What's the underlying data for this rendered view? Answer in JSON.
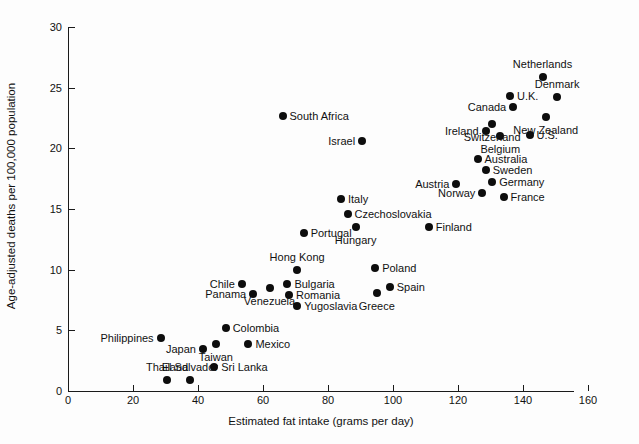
{
  "chart_data": {
    "type": "scatter",
    "title": "",
    "xlabel": "Estimated fat intake (grams per day)",
    "ylabel": "Age-adjusted deaths per 100,000 population",
    "xlim": [
      0,
      175
    ],
    "ylim": [
      0,
      30
    ],
    "xticks": [
      0,
      20,
      40,
      60,
      80,
      100,
      120,
      140,
      160
    ],
    "xtick_labels": [
      "0",
      "20",
      "40",
      "60",
      "80",
      "100",
      "120",
      "140",
      "160"
    ],
    "yticks": [
      0,
      5,
      10,
      15,
      20,
      25,
      30
    ],
    "ytick_labels": [
      "0",
      "5",
      "10",
      "15",
      "20",
      "25",
      "30"
    ],
    "grid": false,
    "legend": "none",
    "marker": "filled-circle",
    "marker_color": "#0d0d0d",
    "points": [
      {
        "label": "Thailand",
        "x": 30.5,
        "y": 0.9,
        "pos": "above"
      },
      {
        "label": "El Salvador",
        "x": 37.5,
        "y": 0.9,
        "pos": "above"
      },
      {
        "label": "Sri Lanka",
        "x": 45.0,
        "y": 2.0,
        "pos": "right"
      },
      {
        "label": "Japan",
        "x": 41.5,
        "y": 3.5,
        "pos": "left"
      },
      {
        "label": "Taiwan",
        "x": 45.5,
        "y": 3.9,
        "pos": "below"
      },
      {
        "label": "Mexico",
        "x": 55.5,
        "y": 3.9,
        "pos": "right"
      },
      {
        "label": "Philippines",
        "x": 28.5,
        "y": 4.4,
        "pos": "left"
      },
      {
        "label": "Colombia",
        "x": 48.5,
        "y": 5.2,
        "pos": "right"
      },
      {
        "label": "Venezuela",
        "x": 62.0,
        "y": 8.5,
        "pos": "below"
      },
      {
        "label": "Panama",
        "x": 57.0,
        "y": 8.0,
        "pos": "left"
      },
      {
        "label": "Chile",
        "x": 53.5,
        "y": 8.8,
        "pos": "left"
      },
      {
        "label": "Yugoslavia",
        "x": 70.5,
        "y": 7.0,
        "pos": "right"
      },
      {
        "label": "Romania",
        "x": 68.0,
        "y": 7.9,
        "pos": "right"
      },
      {
        "label": "Bulgaria",
        "x": 67.5,
        "y": 8.8,
        "pos": "right"
      },
      {
        "label": "Hong Kong",
        "x": 70.5,
        "y": 10.0,
        "pos": "above"
      },
      {
        "label": "Greece",
        "x": 95.0,
        "y": 8.1,
        "pos": "below"
      },
      {
        "label": "Spain",
        "x": 99.0,
        "y": 8.6,
        "pos": "right"
      },
      {
        "label": "Poland",
        "x": 94.5,
        "y": 10.1,
        "pos": "right"
      },
      {
        "label": "Portugal",
        "x": 72.5,
        "y": 13.0,
        "pos": "right"
      },
      {
        "label": "Hungary",
        "x": 88.5,
        "y": 13.5,
        "pos": "below"
      },
      {
        "label": "Czechoslovakia",
        "x": 86.0,
        "y": 14.6,
        "pos": "right"
      },
      {
        "label": "Finland",
        "x": 111.0,
        "y": 13.5,
        "pos": "right"
      },
      {
        "label": "Italy",
        "x": 84.0,
        "y": 15.8,
        "pos": "right"
      },
      {
        "label": "Austria",
        "x": 119.5,
        "y": 17.1,
        "pos": "left"
      },
      {
        "label": "Norway",
        "x": 127.5,
        "y": 16.3,
        "pos": "left"
      },
      {
        "label": "France",
        "x": 134.0,
        "y": 16.0,
        "pos": "right"
      },
      {
        "label": "Germany",
        "x": 130.5,
        "y": 17.2,
        "pos": "right"
      },
      {
        "label": "Sweden",
        "x": 128.5,
        "y": 18.2,
        "pos": "right"
      },
      {
        "label": "Australia",
        "x": 126.0,
        "y": 19.1,
        "pos": "right"
      },
      {
        "label": "Israel",
        "x": 90.5,
        "y": 20.6,
        "pos": "left"
      },
      {
        "label": "Belgium",
        "x": 133.0,
        "y": 21.0,
        "pos": "below"
      },
      {
        "label": "U.S.",
        "x": 142.0,
        "y": 21.1,
        "pos": "right"
      },
      {
        "label": "Ireland",
        "x": 128.5,
        "y": 21.4,
        "pos": "left"
      },
      {
        "label": "Switzerland",
        "x": 130.5,
        "y": 22.0,
        "pos": "below"
      },
      {
        "label": "New Zealand",
        "x": 147.0,
        "y": 22.6,
        "pos": "below"
      },
      {
        "label": "South Africa",
        "x": 66.0,
        "y": 22.7,
        "pos": "right"
      },
      {
        "label": "Canada",
        "x": 137.0,
        "y": 23.4,
        "pos": "left"
      },
      {
        "label": "Denmark",
        "x": 150.5,
        "y": 24.2,
        "pos": "above"
      },
      {
        "label": "U.K.",
        "x": 136.0,
        "y": 24.3,
        "pos": "right"
      },
      {
        "label": "Netherlands",
        "x": 146.0,
        "y": 25.9,
        "pos": "above"
      }
    ]
  }
}
